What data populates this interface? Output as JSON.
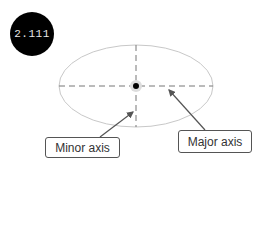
{
  "badge": {
    "text": "2.111",
    "background": "#000000"
  },
  "diagram": {
    "shape": "ellipse",
    "ellipse": {
      "cx": 136,
      "cy": 86,
      "rx": 77,
      "ry": 41,
      "stroke": "#c8c8c8"
    },
    "center_point": "focus/center dot",
    "axes_style": "dashed"
  },
  "labels": {
    "minor_axis": "Minor axis",
    "major_axis": "Major axis"
  }
}
